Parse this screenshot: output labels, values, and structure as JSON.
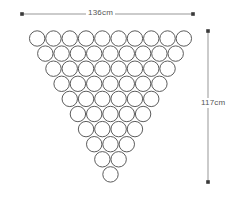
{
  "diagram": {
    "background_color": "#ffffff",
    "stroke_color": "#4a4a4a",
    "dimension_color": "#555555",
    "width_dimension": {
      "label": "136cm",
      "value": 136,
      "unit": "cm",
      "orientation": "horizontal",
      "start_x": 22,
      "end_x": 193,
      "y": 14
    },
    "height_dimension": {
      "label": "117cm",
      "value": 117,
      "unit": "cm",
      "orientation": "vertical",
      "x": 208,
      "start_y": 31,
      "end_y": 182
    }
  },
  "chart_data": {
    "type": "diagram",
    "shape": "triangle",
    "total_circles": 55,
    "row_count": 10,
    "row_counts": [
      10,
      9,
      8,
      7,
      6,
      5,
      4,
      3,
      2,
      1
    ],
    "circle_diameter_px": 16.3,
    "horizontal_pitch_px": 16.3,
    "vertical_pitch_px": 15.1,
    "first_row_center_y": 38.5,
    "center_x": 110.5,
    "overall_width_label": "136cm",
    "overall_height_label": "117cm"
  }
}
